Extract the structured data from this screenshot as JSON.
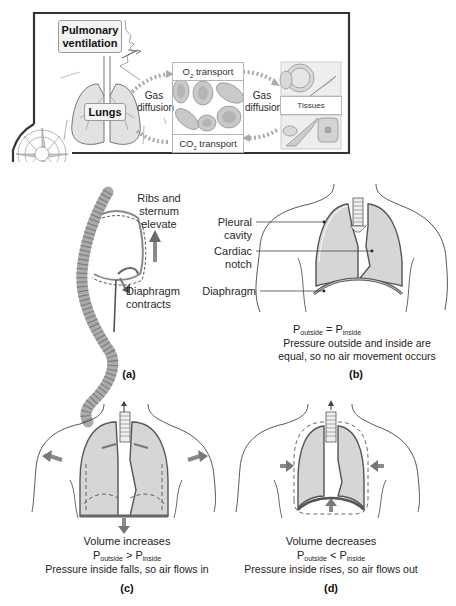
{
  "figure": {
    "top_panel": {
      "pulmonary_ventilation_label": "Pulmonary ventilation",
      "lungs_label": "Lungs",
      "gas_diffusion_left": "Gas diffusion",
      "gas_diffusion_right": "Gas diffusion",
      "o2_transport": {
        "prefix": "O",
        "sub": "2",
        "suffix": " transport"
      },
      "co2_transport": {
        "prefix": "CO",
        "sub": "2",
        "suffix": " transport"
      },
      "tissues_label": "Tissues"
    },
    "panel_a": {
      "tag": "(a)",
      "ribs_label": "Ribs and sternum elevate",
      "diaphragm_label": "Diaphragm contracts"
    },
    "panel_b": {
      "tag": "(b)",
      "pleural_label": "Pleural cavity",
      "cardiac_label": "Cardiac notch",
      "diaphragm_label": "Diaphragm",
      "equation": {
        "left": "P",
        "left_sub": "outside",
        "op": " = ",
        "right": "P",
        "right_sub": "inside"
      },
      "caption": "Pressure outside and inside are equal, so no air movement occurs"
    },
    "panel_c": {
      "tag": "(c)",
      "volume_text": "Volume increases",
      "equation": {
        "left": "P",
        "left_sub": "outside",
        "op": " > ",
        "right": "P",
        "right_sub": "inside"
      },
      "caption": "Pressure inside falls, so air flows in"
    },
    "panel_d": {
      "tag": "(d)",
      "volume_text": "Volume decreases",
      "equation": {
        "left": "P",
        "left_sub": "outside",
        "op": " < ",
        "right": "P",
        "right_sub": "inside"
      },
      "caption": "Pressure inside rises, so air flows out"
    },
    "colors": {
      "lung_fill": "#d6d6d6",
      "outline": "#555555",
      "arrow": "#8a8a8a",
      "frame": "#333333"
    }
  }
}
